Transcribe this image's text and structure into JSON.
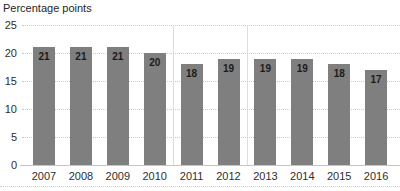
{
  "chart": {
    "title": "Percentage points"
  },
  "chart_data": {
    "type": "bar",
    "title": "Percentage points",
    "categories": [
      "2007",
      "2008",
      "2009",
      "2010",
      "2011",
      "2012",
      "2013",
      "2014",
      "2015",
      "2016"
    ],
    "values": [
      21,
      21,
      21,
      20,
      18,
      19,
      19,
      19,
      18,
      17
    ],
    "value_labels": [
      "21",
      "21",
      "21",
      "20",
      "18",
      "19",
      "19",
      "19",
      "18",
      "17"
    ],
    "xlabel": "",
    "ylabel": "Percentage points",
    "ylim": [
      0,
      25
    ],
    "yticks": [
      0,
      5,
      10,
      15,
      20,
      25
    ],
    "grid": "horizontal-dotted",
    "legend": "none",
    "bar_color": "#7f7f7f",
    "value_label_color": "#1b1b1b",
    "gridline_color": "#c9c9c9",
    "dividers_after_categories": [
      "2010",
      "2012"
    ]
  }
}
